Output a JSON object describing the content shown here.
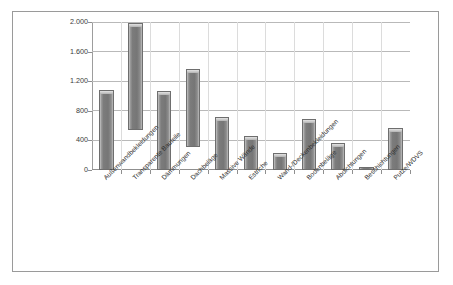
{
  "chart_data": {
    "type": "bar",
    "title": "",
    "subtitle": "",
    "xlabel": "",
    "ylabel": "Primärenergiegehalt (nicht erneuerbar) in MJ/m²",
    "ylim": [
      0,
      2000
    ],
    "ytick_labels": [
      "0",
      "400",
      "800",
      "1.200",
      "1.600",
      "2.000"
    ],
    "ytick_values": [
      0,
      400,
      800,
      1200,
      1600,
      2000
    ],
    "grid": true,
    "legend": "none",
    "note": "Bars are floating range bars: each category shows a minimum and maximum value.",
    "categories": [
      "Außenwandbekleidungen",
      "Transparente Bauteile",
      "Dämmungen",
      "Dachbeläge",
      "Massive Wände",
      "Estriche",
      "Wand-/Deckenbekleidungen",
      "Bodenbeläge",
      "Abdichtungen",
      "Beschichtungen",
      "Putze/WDVS"
    ],
    "series": [
      {
        "name": "Spannweite Primärenergiegehalt",
        "low": [
          0,
          540,
          0,
          310,
          0,
          0,
          0,
          0,
          0,
          0,
          0
        ],
        "high": [
          1080,
          1990,
          1070,
          1370,
          710,
          460,
          230,
          690,
          370,
          35,
          570
        ]
      }
    ],
    "bar_color": "#7c7c7c",
    "grid_color": "#b9b9b9",
    "axis_color": "#8f8f8f",
    "frame_color": "#9a9a9a",
    "background": "#ffffff"
  }
}
